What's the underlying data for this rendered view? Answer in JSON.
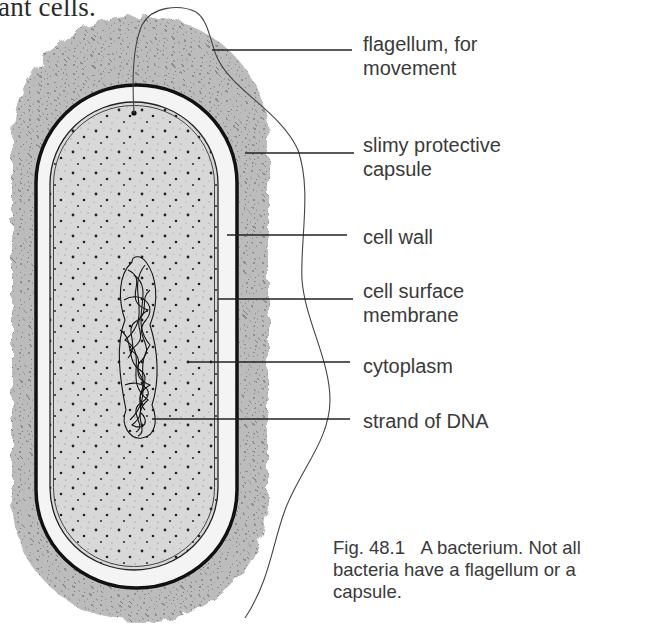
{
  "header": {
    "intro_text_fragment": "ant cells."
  },
  "figure": {
    "labels": [
      {
        "id": "flagellum",
        "line1": "flagellum, for",
        "line2": "movement"
      },
      {
        "id": "capsule",
        "line1": "slimy protective",
        "line2": "capsule"
      },
      {
        "id": "cell-wall",
        "line1": "cell wall",
        "line2": ""
      },
      {
        "id": "cell-surface-membrane",
        "line1": "cell surface",
        "line2": "membrane"
      },
      {
        "id": "cytoplasm",
        "line1": "cytoplasm",
        "line2": ""
      },
      {
        "id": "dna",
        "line1": "strand of DNA",
        "line2": ""
      }
    ],
    "caption": {
      "number": "Fig. 48.1",
      "line1": "A bacterium. Not all",
      "line2": "bacteria have a flagellum or a",
      "line3": "capsule."
    },
    "colors": {
      "capsule_fill": "#b9b9b9",
      "cell_wall": "#111111",
      "wall_gap": "#f4f4f4",
      "cytoplasm_fill": "#d6d6d6",
      "ink": "#1a1a1a",
      "label_text": "#3a3a3a"
    }
  }
}
